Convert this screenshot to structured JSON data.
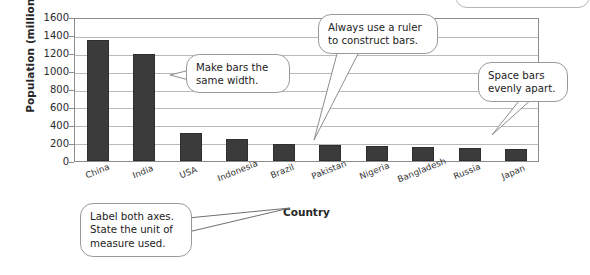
{
  "chart_data": {
    "type": "bar",
    "title": "",
    "xlabel": "Country",
    "ylabel": "Population (millions)",
    "categories": [
      "China",
      "India",
      "USA",
      "Indonesia",
      "Brazil",
      "Pakistan",
      "Nigeria",
      "Bangladesh",
      "Russia",
      "Japan"
    ],
    "values": [
      1350,
      1200,
      310,
      250,
      195,
      180,
      165,
      160,
      145,
      130
    ],
    "ylim": [
      0,
      1600
    ],
    "ytick_labels": [
      "1600",
      "1400",
      "1200",
      "1000",
      "800",
      "600",
      "400",
      "200",
      "0"
    ],
    "ytick_values": [
      1600,
      1400,
      1200,
      1000,
      800,
      600,
      400,
      200,
      0
    ],
    "ytick_step": 200,
    "grid": true,
    "legend": false,
    "bar_color": "#3b3b3b",
    "plot_border_color": "#8c8c8c",
    "gridline_color": "#b9b9b9"
  },
  "annotations": {
    "bar_width": {
      "line1": "Make bars the",
      "line2": "same width."
    },
    "ruler": {
      "line1": "Always use a ruler",
      "line2": "to construct bars."
    },
    "spacing": {
      "line1": "Space bars",
      "line2": "evenly apart."
    },
    "axis_labels": {
      "line1": "Label both axes.",
      "line2": "State the unit of",
      "line3": "measure used."
    }
  }
}
